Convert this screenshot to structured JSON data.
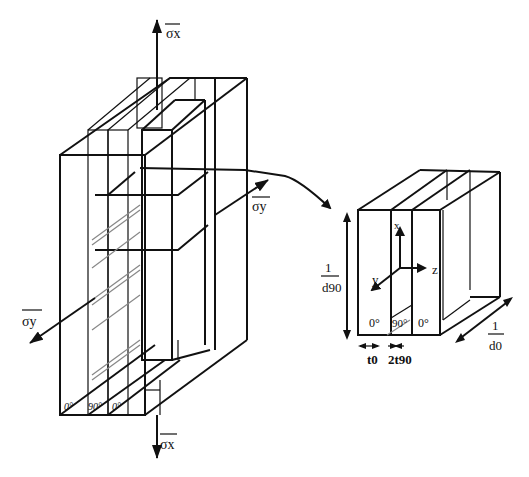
{
  "figure": {
    "type": "laminate-schematic"
  },
  "left_structure": {
    "stress_labels": {
      "top": "σx",
      "bottom": "σx",
      "right": "σy",
      "left": "σy"
    },
    "ply_labels": [
      "0°",
      "90°",
      "0°"
    ]
  },
  "right_element": {
    "axes": {
      "x": "x",
      "y": "y",
      "z": "z"
    },
    "ply_labels": [
      "0°",
      "90°",
      "0°"
    ],
    "dimensions": {
      "height_num": "1",
      "height_den": "d90",
      "depth_num": "1",
      "depth_den": "d0",
      "t0": "t0",
      "t90": "2t90"
    }
  }
}
